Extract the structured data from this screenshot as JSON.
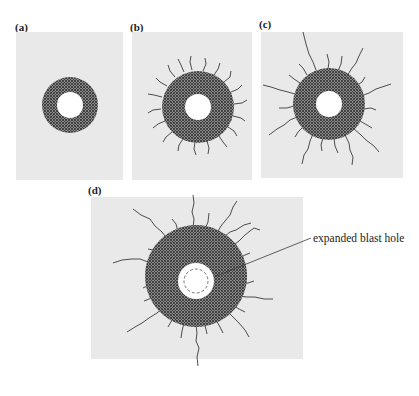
{
  "figure": {
    "panels": [
      {
        "id": "a",
        "label": "(a)"
      },
      {
        "id": "b",
        "label": "(b)"
      },
      {
        "id": "c",
        "label": "(c)"
      },
      {
        "id": "d",
        "label": "(d)"
      }
    ],
    "annotation": "expanded blast hole"
  },
  "colors": {
    "panel_bg": "#e9e9e9",
    "crushed_zone": "#5a5a5a",
    "hole": "#ffffff",
    "crack": "#3a3a3a"
  }
}
